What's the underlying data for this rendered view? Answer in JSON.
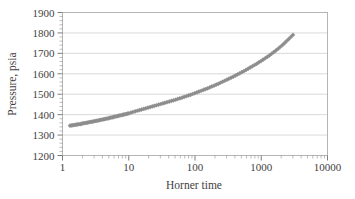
{
  "chart_data": {
    "type": "scatter",
    "title": "",
    "subtitle": "",
    "xlabel": "Horner time",
    "ylabel": "Pressure, psia",
    "xscale": "log",
    "yscale": "linear",
    "xlim": [
      1,
      10000
    ],
    "ylim": [
      1200,
      1900
    ],
    "xticks": [
      1,
      10,
      100,
      1000,
      10000
    ],
    "xtick_labels": [
      "1",
      "10",
      "100",
      "1000",
      "10000"
    ],
    "yticks": [
      1200,
      1300,
      1400,
      1500,
      1600,
      1700,
      1800,
      1900
    ],
    "ytick_labels": [
      "1200",
      "1300",
      "1400",
      "1500",
      "1600",
      "1700",
      "1800",
      "1900"
    ],
    "grid": "horizontal",
    "legend": "none",
    "marker": "diamond",
    "marker_color": "#8d8d8d",
    "line_color": "#8d8d8d",
    "series": [
      {
        "name": "Pressure buildup",
        "x": [
          1.3,
          1.36,
          1.42,
          1.48,
          1.55,
          1.62,
          1.69,
          1.77,
          1.85,
          1.93,
          2.02,
          2.11,
          2.21,
          2.31,
          2.41,
          2.52,
          2.64,
          2.76,
          2.88,
          3.01,
          3.15,
          3.29,
          3.44,
          3.6,
          3.76,
          3.93,
          4.11,
          4.3,
          4.49,
          4.7,
          4.91,
          5.13,
          5.37,
          5.61,
          5.87,
          6.13,
          6.41,
          6.7,
          7.01,
          7.33,
          7.66,
          8.01,
          8.37,
          8.75,
          9.15,
          9.57,
          10.0,
          10.8,
          11.6,
          12.5,
          13.5,
          14.5,
          15.6,
          16.8,
          18.1,
          19.5,
          21.0,
          22.6,
          24.3,
          26.2,
          28.2,
          30.4,
          32.7,
          35.2,
          37.9,
          40.8,
          44.0,
          47.3,
          51.0,
          54.9,
          59.1,
          63.7,
          68.6,
          73.8,
          79.5,
          85.6,
          92.2,
          99.3,
          107,
          115,
          124,
          134,
          144,
          155,
          167,
          180,
          194,
          209,
          225,
          242,
          261,
          281,
          303,
          326,
          351,
          378,
          407,
          438,
          472,
          508,
          547,
          589,
          634,
          683,
          735,
          792,
          853,
          918,
          989,
          1065,
          1147,
          1236,
          1331,
          1433,
          1543,
          1662,
          1790,
          1928,
          2076,
          2236,
          2408,
          2593,
          2793,
          3008
        ],
        "y": [
          1346,
          1347,
          1348,
          1349,
          1350,
          1351,
          1352,
          1353,
          1354,
          1355,
          1357,
          1358,
          1359,
          1360,
          1361,
          1363,
          1364,
          1365,
          1366,
          1368,
          1369,
          1370,
          1371,
          1373,
          1374,
          1375,
          1377,
          1378,
          1379,
          1381,
          1382,
          1384,
          1385,
          1387,
          1388,
          1390,
          1391,
          1393,
          1394,
          1396,
          1397,
          1399,
          1400,
          1402,
          1403,
          1405,
          1406,
          1410,
          1413,
          1416,
          1419,
          1422,
          1425,
          1428,
          1431,
          1434,
          1437,
          1440,
          1443,
          1446,
          1449,
          1452,
          1455,
          1458,
          1461,
          1464,
          1467,
          1470,
          1473,
          1477,
          1480,
          1483,
          1487,
          1490,
          1494,
          1497,
          1501,
          1505,
          1509,
          1513,
          1517,
          1521,
          1525,
          1529,
          1533,
          1538,
          1542,
          1547,
          1551,
          1556,
          1561,
          1566,
          1571,
          1576,
          1581,
          1586,
          1591,
          1597,
          1602,
          1608,
          1613,
          1619,
          1625,
          1631,
          1637,
          1643,
          1649,
          1656,
          1662,
          1669,
          1676,
          1683,
          1690,
          1698,
          1706,
          1714,
          1722,
          1731,
          1740,
          1750,
          1760,
          1770,
          1780,
          1790
        ]
      }
    ]
  },
  "axes": {
    "y_title": "Pressure, psia",
    "x_title": "Horner time"
  }
}
